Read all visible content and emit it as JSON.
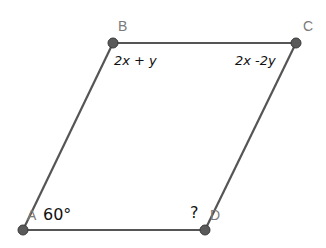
{
  "figure": {
    "type": "parallelogram",
    "line_color": "#555555",
    "point_color": "#555555",
    "vertices": [
      {
        "name": "A",
        "x": 23,
        "y": 230
      },
      {
        "name": "B",
        "x": 113,
        "y": 43
      },
      {
        "name": "C",
        "x": 296,
        "y": 43
      },
      {
        "name": "D",
        "x": 205,
        "y": 230
      }
    ],
    "labels": {
      "A": "A",
      "B": "B",
      "C": "C",
      "D": "D"
    },
    "annotations": {
      "angle_B": "2x + y",
      "angle_C": "2x -2y",
      "angle_A": "60°",
      "angle_D": "?"
    }
  }
}
